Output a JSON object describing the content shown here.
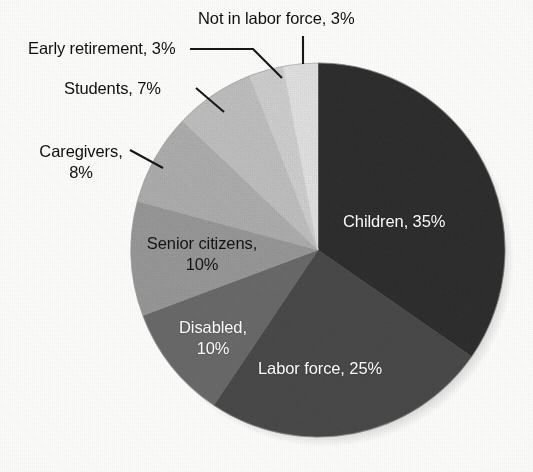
{
  "chart_data": {
    "type": "pie",
    "title": "",
    "subtitle": "",
    "xlabel": "",
    "ylabel": "",
    "legend_position": "none",
    "grid": false,
    "units": "percent",
    "total": 101,
    "start_angle_deg": 0,
    "direction": "clockwise",
    "categories": [
      "Children",
      "Labor force",
      "Disabled",
      "Senior citizens",
      "Caregivers",
      "Students",
      "Early retirement",
      "Not in labor force"
    ],
    "values": [
      35,
      25,
      10,
      10,
      8,
      7,
      3,
      3
    ],
    "slices": [
      {
        "name": "children",
        "label": "Children, 35%",
        "category": "Children",
        "value": 35,
        "value_text": "35%",
        "color": "#2f2f2f",
        "label_color": "#ffffff",
        "label_placement": "inside"
      },
      {
        "name": "labor-force",
        "label": "Labor force, 25%",
        "category": "Labor force",
        "value": 25,
        "value_text": "25%",
        "color": "#4c4c4c",
        "label_color": "#ffffff",
        "label_placement": "inside"
      },
      {
        "name": "disabled",
        "label": "Disabled, 10%",
        "category": "Disabled",
        "value": 10,
        "value_text": "10%",
        "color": "#6d6d6d",
        "label_color": "#ffffff",
        "label_placement": "inside"
      },
      {
        "name": "senior-citizens",
        "label": "Senior citizens, 10%",
        "category": "Senior citizens",
        "value": 10,
        "value_text": "10%",
        "color": "#9c9c9c",
        "label_color": "#141414",
        "label_placement": "inside"
      },
      {
        "name": "caregivers",
        "label": "Caregivers, 8%",
        "category": "Caregivers",
        "value": 8,
        "value_text": "8%",
        "color": "#b2b2b2",
        "label_color": "#101010",
        "label_placement": "callout"
      },
      {
        "name": "students",
        "label": "Students, 7%",
        "category": "Students",
        "value": 7,
        "value_text": "7%",
        "color": "#c4c4c4",
        "label_color": "#101010",
        "label_placement": "callout"
      },
      {
        "name": "early-retirement",
        "label": "Early retirement, 3%",
        "category": "Early retirement",
        "value": 3,
        "value_text": "3%",
        "color": "#d4d4d4",
        "label_color": "#101010",
        "label_placement": "callout"
      },
      {
        "name": "not-in-labor-force",
        "label": "Not in labor force, 3%",
        "category": "Not in labor force",
        "value": 3,
        "value_text": "3%",
        "color": "#e7e7e7",
        "label_color": "#101010",
        "label_placement": "callout"
      }
    ]
  },
  "labels": {
    "children": "Children, 35%",
    "labor_force": "Labor force, 25%",
    "disabled_line1": "Disabled,",
    "disabled_line2": "10%",
    "senior_citizens_line1": "Senior citizens,",
    "senior_citizens_line2": "10%",
    "caregivers_line1": "Caregivers,",
    "caregivers_line2": "8%",
    "students": "Students, 7%",
    "early_retirement": "Early retirement, 3%",
    "not_in_labor_force": "Not in labor force, 3%"
  },
  "colors": {
    "background": "#fdfdfc",
    "outline": "#8a8a8a",
    "leader_line": "#171717",
    "label_light": "#ffffff",
    "label_dark": "#101010"
  }
}
